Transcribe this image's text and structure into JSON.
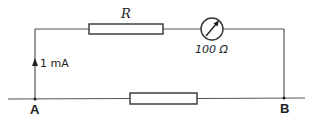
{
  "diagram": {
    "type": "circuit",
    "components": {
      "resistor_top": {
        "label": "R"
      },
      "meter": {
        "label": "100 Ω",
        "symbol": "meter-arrow-icon"
      },
      "resistor_bottom": {
        "label": ""
      }
    },
    "current": {
      "label": "1 mA",
      "direction": "up"
    },
    "nodes": {
      "a": {
        "label": "A"
      },
      "b": {
        "label": "B"
      }
    },
    "colors": {
      "wire": "#555555",
      "component_outline": "#333333",
      "text": "#222222",
      "background": "#ffffff"
    }
  }
}
